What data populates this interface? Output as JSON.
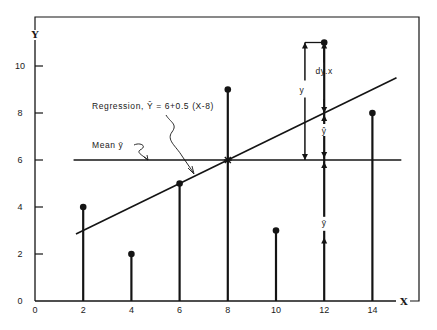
{
  "chart_data": {
    "type": "scatter",
    "title": "",
    "xlabel": "X",
    "ylabel": "Y",
    "xlim": [
      0,
      15
    ],
    "ylim": [
      0,
      11
    ],
    "grid": false,
    "x_ticks": [
      "0",
      "2",
      "4",
      "6",
      "8",
      "10",
      "12",
      "14"
    ],
    "y_ticks": [
      "0",
      "2",
      "4",
      "6",
      "8",
      "10"
    ],
    "points": [
      {
        "x": 2,
        "y": 4
      },
      {
        "x": 4,
        "y": 2
      },
      {
        "x": 6,
        "y": 5
      },
      {
        "x": 8,
        "y": 9
      },
      {
        "x": 10,
        "y": 3
      },
      {
        "x": 12,
        "y": 11
      },
      {
        "x": 14,
        "y": 8
      }
    ],
    "series": [
      {
        "name": "Observations",
        "x": [
          2,
          4,
          6,
          8,
          10,
          12,
          14
        ],
        "values": [
          4,
          2,
          5,
          9,
          3,
          11,
          8
        ]
      }
    ],
    "mean_line": {
      "label": "Mean",
      "symbol": "ȳ",
      "value": 6
    },
    "regression": {
      "label": "Regression,",
      "equation": "Ŷ = 6+0.5 (X-8)",
      "intercept_at_mean_x": 6,
      "slope": 0.5,
      "mean_x": 8
    },
    "annotations": {
      "total_y": "y",
      "deviation": "dy.x",
      "y_hat": "ŷ",
      "y_bar": "ȳ"
    }
  },
  "labels": {
    "x_axis": "X",
    "y_axis": "Y",
    "regression_text": "Regression,  Ŷ = 6+0.5 (X-8)",
    "mean_text": "Mean  ȳ",
    "y_label": "y",
    "dyx_label": "dy.x",
    "yhat_label": "ŷ",
    "ybar_label": "ȳ"
  }
}
